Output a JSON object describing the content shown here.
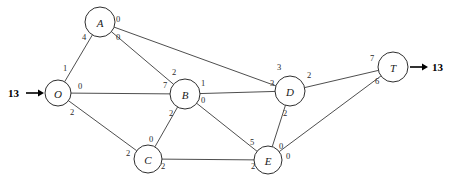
{
  "diagram": {
    "type": "network-flow-graph",
    "width": 449,
    "height": 186,
    "background_color": "#ffffff",
    "line_color": "#3a3a3a",
    "text_color": "#2a2a2a"
  },
  "source": {
    "label": "13",
    "node": "O",
    "direction": "in"
  },
  "sink": {
    "label": "13",
    "node": "T",
    "direction": "out"
  },
  "nodes": [
    {
      "id": "O",
      "label": "O",
      "cx": 58,
      "cy": 93,
      "r": 13
    },
    {
      "id": "A",
      "label": "A",
      "cx": 100,
      "cy": 22,
      "r": 15
    },
    {
      "id": "B",
      "label": "B",
      "cx": 185,
      "cy": 94,
      "r": 15
    },
    {
      "id": "C",
      "label": "C",
      "cx": 148,
      "cy": 159,
      "r": 14
    },
    {
      "id": "D",
      "label": "D",
      "cx": 290,
      "cy": 91,
      "r": 15
    },
    {
      "id": "E",
      "label": "E",
      "cx": 268,
      "cy": 160,
      "r": 14
    },
    {
      "id": "T",
      "label": "T",
      "cx": 393,
      "cy": 67,
      "r": 15
    }
  ],
  "edges": [
    {
      "from": "O",
      "to": "A",
      "from_label": "1",
      "to_label": "4",
      "from_label_x": 65,
      "from_label_y": 68,
      "to_label_x": 84,
      "to_label_y": 37
    },
    {
      "from": "O",
      "to": "B",
      "from_label": "0",
      "to_label": "7",
      "from_label_x": 80,
      "from_label_y": 86,
      "to_label_x": 165,
      "to_label_y": 85
    },
    {
      "from": "O",
      "to": "C",
      "from_label": "2",
      "to_label": "2",
      "from_label_x": 72,
      "from_label_y": 112,
      "to_label_x": 128,
      "to_label_y": 153
    },
    {
      "from": "A",
      "to": "B",
      "from_label": "0",
      "to_label": "2",
      "from_label_x": 118,
      "from_label_y": 37,
      "to_label_x": 174,
      "to_label_y": 72
    },
    {
      "from": "A",
      "to": "D",
      "from_label": "0",
      "to_label": "3",
      "from_label_x": 118,
      "from_label_y": 19,
      "to_label_x": 279,
      "to_label_y": 67
    },
    {
      "from": "B",
      "to": "C",
      "from_label": "2",
      "to_label": "0",
      "from_label_x": 171,
      "from_label_y": 113,
      "to_label_x": 151,
      "to_label_y": 139
    },
    {
      "from": "B",
      "to": "D",
      "from_label": "1",
      "to_label": "3",
      "from_label_x": 203,
      "from_label_y": 83,
      "to_label_x": 272,
      "to_label_y": 83
    },
    {
      "from": "B",
      "to": "E",
      "from_label": "0",
      "to_label": "5",
      "from_label_x": 203,
      "from_label_y": 100,
      "to_label_x": 252,
      "to_label_y": 142
    },
    {
      "from": "C",
      "to": "E",
      "from_label": "2",
      "to_label": "2",
      "from_label_x": 163,
      "from_label_y": 166,
      "to_label_x": 253,
      "to_label_y": 166
    },
    {
      "from": "D",
      "to": "E",
      "from_label": "2",
      "to_label": "0",
      "from_label_x": 285,
      "from_label_y": 113,
      "to_label_x": 281,
      "to_label_y": 146
    },
    {
      "from": "D",
      "to": "T",
      "from_label": "2",
      "to_label": "7",
      "from_label_x": 309,
      "from_label_y": 75,
      "to_label_x": 372,
      "to_label_y": 58
    },
    {
      "from": "E",
      "to": "T",
      "from_label": "0",
      "to_label": "6",
      "from_label_x": 288,
      "from_label_y": 156,
      "to_label_x": 377,
      "to_label_y": 81
    }
  ]
}
